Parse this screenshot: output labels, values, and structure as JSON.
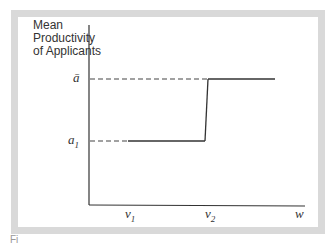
{
  "diagram": {
    "y_axis_label": "Mean\nProductivity\nof Applicants",
    "x_axis_label": "w",
    "y_ticks": [
      {
        "label": "ā",
        "name": "a-bar"
      },
      {
        "label": "a",
        "sub": "1",
        "name": "a1"
      }
    ],
    "x_ticks": [
      {
        "label": "v",
        "sub": "1",
        "name": "v1"
      },
      {
        "label": "v",
        "sub": "2",
        "name": "v2"
      }
    ],
    "curve": "step function: mean productivity equals a1 for w below v2, jumps to ā at w = v2",
    "caption_fragment": "Fi"
  },
  "colors": {
    "frame": "#d9d9d9",
    "line": "#333333",
    "background": "#ffffff"
  }
}
